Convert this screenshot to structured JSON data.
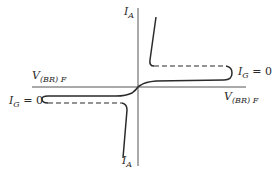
{
  "diagram": {
    "labels": {
      "y_axis_top": {
        "main": "I",
        "sub": "A"
      },
      "y_axis_bottom": {
        "main": "I",
        "sub": "A"
      },
      "x_axis_left": {
        "main": "V",
        "sub": "(BR) F"
      },
      "x_axis_right": {
        "main": "V",
        "sub": "(BR) F"
      },
      "gate_right": {
        "main": "I",
        "sub": "G",
        "suffix": " = 0"
      },
      "gate_left": {
        "main": "I",
        "sub": "G",
        "suffix": " = 0"
      }
    },
    "colors": {
      "ink": "#2a2a2a",
      "axis": "#555555",
      "background": "#ffffff"
    }
  }
}
